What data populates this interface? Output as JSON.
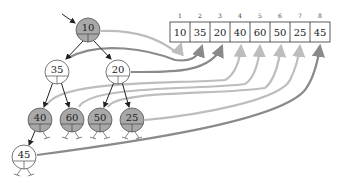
{
  "diagram": {
    "colors": {
      "filled_node": "#a8a8a8",
      "empty_node": "#ffffff",
      "edge": "#222222",
      "arrow_light": "#bdbdbd",
      "arrow_dark": "#8a8a8a"
    },
    "tree": {
      "nodes": [
        {
          "id": "n1",
          "value": "10",
          "filled": true,
          "cx": 88,
          "cy": 30
        },
        {
          "id": "n2",
          "value": "35",
          "filled": false,
          "cx": 57,
          "cy": 72
        },
        {
          "id": "n3",
          "value": "20",
          "filled": false,
          "cx": 118,
          "cy": 72
        },
        {
          "id": "n4",
          "value": "40",
          "filled": true,
          "cx": 40,
          "cy": 120
        },
        {
          "id": "n5",
          "value": "60",
          "filled": true,
          "cx": 72,
          "cy": 120
        },
        {
          "id": "n6",
          "value": "50",
          "filled": true,
          "cx": 100,
          "cy": 120
        },
        {
          "id": "n7",
          "value": "25",
          "filled": true,
          "cx": 132,
          "cy": 120
        },
        {
          "id": "n8",
          "value": "45",
          "filled": false,
          "cx": 24,
          "cy": 157
        }
      ],
      "edges": [
        [
          "n1",
          "n2"
        ],
        [
          "n1",
          "n3"
        ],
        [
          "n2",
          "n4"
        ],
        [
          "n2",
          "n5"
        ],
        [
          "n3",
          "n6"
        ],
        [
          "n3",
          "n7"
        ],
        [
          "n4",
          "n8"
        ]
      ]
    },
    "array": {
      "indices": [
        "1",
        "2",
        "3",
        "4",
        "5",
        "6",
        "7",
        "8"
      ],
      "values": [
        "10",
        "35",
        "20",
        "40",
        "60",
        "50",
        "25",
        "45"
      ]
    }
  }
}
